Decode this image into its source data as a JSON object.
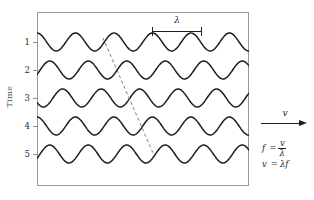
{
  "figure": {
    "type": "wave-propagation-diagram",
    "background_color": "#ffffff",
    "frame_color": "#9a9a9a",
    "wave_color": "#1d1d1d",
    "dashed_line_color": "#6e6e6e"
  },
  "axis": {
    "y_title": "Time",
    "y_tick_labels": [
      "1",
      "2",
      "3",
      "4",
      "5"
    ]
  },
  "annotations": {
    "wavelength_symbol": "λ",
    "velocity_symbol": "v"
  },
  "formulas": [
    {
      "lhs": "f",
      "eq": "=",
      "numerator": "v",
      "denominator": "λ"
    },
    {
      "lhs": "v",
      "eq": "=",
      "rhs": "λf"
    }
  ],
  "chart_data": {
    "type": "line",
    "title": "",
    "xlabel": "",
    "ylabel": "Time",
    "grid": false,
    "legend": null,
    "x_range": [
      0,
      212
    ],
    "wave": {
      "wavelength_px": 38.5,
      "amplitude_px": 9,
      "cycles_visible": 5.5,
      "phase_shift_per_row_px": 12.8
    },
    "series": [
      {
        "name": "1",
        "baseline_y": 42,
        "phase_offset_px": 0.0
      },
      {
        "name": "2",
        "baseline_y": 70,
        "phase_offset_px": 12.8
      },
      {
        "name": "3",
        "baseline_y": 98,
        "phase_offset_px": 25.6
      },
      {
        "name": "4",
        "baseline_y": 126,
        "phase_offset_px": 38.4
      },
      {
        "name": "5",
        "baseline_y": 154,
        "phase_offset_px": 51.2
      }
    ],
    "crest_track_line": {
      "style": "dashed",
      "x_start": 103,
      "y_start": 38,
      "x_end": 153,
      "y_end": 153
    },
    "wavelength_bar": {
      "x_start": 152,
      "x_end": 202,
      "y": 31,
      "label": "λ"
    }
  }
}
